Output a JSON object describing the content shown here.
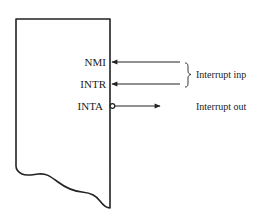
{
  "diagram": {
    "type": "interrupt-pin-diagram",
    "chip": {
      "shape": "rectangle-with-torn-bottom",
      "stroke_color": "#222222"
    },
    "pins": [
      {
        "name": "NMI",
        "direction": "input",
        "y": 62
      },
      {
        "name": "INTR",
        "direction": "input",
        "y": 84
      },
      {
        "name": "INTA",
        "direction": "output",
        "active_low": true,
        "y": 106
      }
    ],
    "groups": [
      {
        "label": "Interrupt inp",
        "brace_for": [
          "NMI",
          "INTR"
        ]
      },
      {
        "label": "Interrupt out",
        "for": [
          "INTA"
        ]
      }
    ]
  }
}
